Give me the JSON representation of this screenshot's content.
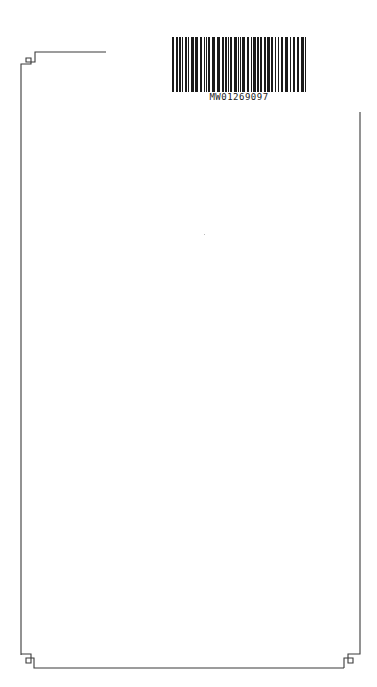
{
  "document": {
    "type": "blank bordered page",
    "barcode": {
      "code": "MW01269097"
    },
    "frame": {
      "stroke_color": "#333333",
      "corner_style": "square-knot ornament"
    }
  }
}
